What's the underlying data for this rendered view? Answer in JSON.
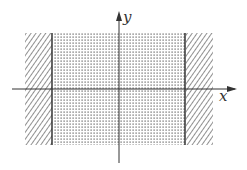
{
  "diagram": {
    "axes": {
      "x_label": "x",
      "y_label": "y"
    },
    "regions": [
      {
        "name": "left-excluded",
        "fill": "hatched",
        "role": "boundary exterior"
      },
      {
        "name": "strip-interior",
        "fill": "dotted",
        "role": "domain"
      },
      {
        "name": "right-excluded",
        "fill": "hatched",
        "role": "boundary exterior"
      }
    ],
    "colors": {
      "ink": "#333333",
      "background": "#ffffff"
    }
  }
}
